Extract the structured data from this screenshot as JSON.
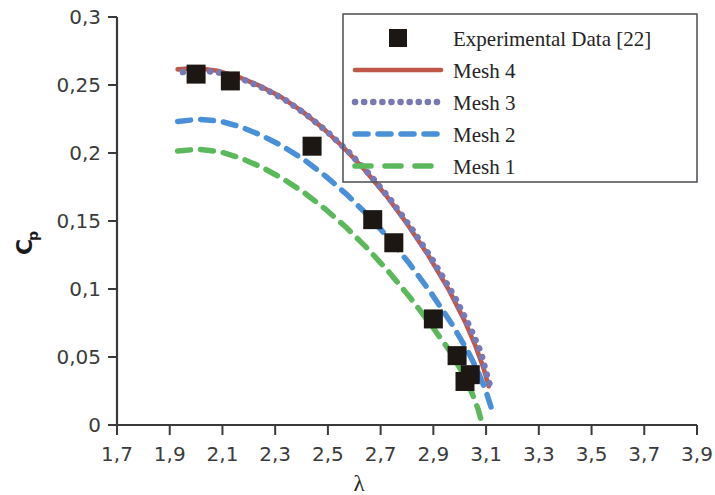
{
  "chart_data": {
    "type": "line",
    "title": "",
    "xlabel": "λ",
    "ylabel": "Cp",
    "ylabel_base": "C",
    "ylabel_sub": "p",
    "xlim": [
      1.7,
      3.9
    ],
    "ylim": [
      0.0,
      0.3
    ],
    "xticks": [
      "1,7",
      "1,9",
      "2,1",
      "2,3",
      "2,5",
      "2,7",
      "2,9",
      "3,1",
      "3,3",
      "3,5",
      "3,7",
      "3,9"
    ],
    "xtick_values": [
      1.7,
      1.9,
      2.1,
      2.3,
      2.5,
      2.7,
      2.9,
      3.1,
      3.3,
      3.5,
      3.7,
      3.9
    ],
    "yticks": [
      "0",
      "0,05",
      "0,1",
      "0,15",
      "0,2",
      "0,25",
      "0,3"
    ],
    "ytick_values": [
      0,
      0.05,
      0.1,
      0.15,
      0.2,
      0.25,
      0.3
    ],
    "grid": false,
    "legend_position": "top-right",
    "decimal_separator": ",",
    "series": [
      {
        "name": "Experimental Data [22]",
        "style": "scatter",
        "marker": "square",
        "color": "#1c1712",
        "points": [
          [
            2.0,
            0.258
          ],
          [
            2.13,
            0.253
          ],
          [
            2.44,
            0.205
          ],
          [
            2.67,
            0.151
          ],
          [
            2.75,
            0.134
          ],
          [
            2.9,
            0.078
          ],
          [
            2.99,
            0.051
          ],
          [
            3.02,
            0.032
          ],
          [
            3.04,
            0.037
          ]
        ]
      },
      {
        "name": "Mesh 4",
        "style": "solid",
        "color": "#c0584a",
        "points": [
          [
            1.93,
            0.2615
          ],
          [
            2.0,
            0.2625
          ],
          [
            2.08,
            0.2605
          ],
          [
            2.16,
            0.256
          ],
          [
            2.24,
            0.2495
          ],
          [
            2.32,
            0.2415
          ],
          [
            2.4,
            0.231
          ],
          [
            2.48,
            0.2185
          ],
          [
            2.56,
            0.204
          ],
          [
            2.64,
            0.1875
          ],
          [
            2.72,
            0.169
          ],
          [
            2.8,
            0.148
          ],
          [
            2.88,
            0.125
          ],
          [
            2.96,
            0.099
          ],
          [
            3.02,
            0.076
          ],
          [
            3.06,
            0.058
          ],
          [
            3.09,
            0.042
          ],
          [
            3.11,
            0.0285
          ]
        ]
      },
      {
        "name": "Mesh 3",
        "style": "dotted",
        "color": "#7878b4",
        "points": [
          [
            1.95,
            0.2595
          ],
          [
            2.02,
            0.2608
          ],
          [
            2.1,
            0.2588
          ],
          [
            2.18,
            0.254
          ],
          [
            2.26,
            0.2472
          ],
          [
            2.34,
            0.2388
          ],
          [
            2.42,
            0.228
          ],
          [
            2.5,
            0.2152
          ],
          [
            2.58,
            0.2005
          ],
          [
            2.66,
            0.1838
          ],
          [
            2.74,
            0.165
          ],
          [
            2.82,
            0.1438
          ],
          [
            2.9,
            0.1205
          ],
          [
            2.98,
            0.0945
          ],
          [
            3.04,
            0.0715
          ],
          [
            3.08,
            0.0535
          ],
          [
            3.1,
            0.039
          ],
          [
            3.12,
            0.0255
          ]
        ]
      },
      {
        "name": "Mesh 2",
        "style": "dashed",
        "color": "#4a90d9",
        "points": [
          [
            1.93,
            0.2232
          ],
          [
            2.01,
            0.2248
          ],
          [
            2.09,
            0.2235
          ],
          [
            2.17,
            0.2192
          ],
          [
            2.25,
            0.2128
          ],
          [
            2.33,
            0.2048
          ],
          [
            2.41,
            0.195
          ],
          [
            2.49,
            0.1832
          ],
          [
            2.57,
            0.1698
          ],
          [
            2.65,
            0.1545
          ],
          [
            2.73,
            0.1375
          ],
          [
            2.81,
            0.1185
          ],
          [
            2.89,
            0.0975
          ],
          [
            2.97,
            0.0742
          ],
          [
            3.03,
            0.0545
          ],
          [
            3.07,
            0.039
          ],
          [
            3.1,
            0.0245
          ],
          [
            3.12,
            0.0125
          ]
        ]
      },
      {
        "name": "Mesh 1",
        "style": "dashed",
        "color": "#5cb85c",
        "points": [
          [
            1.93,
            0.2015
          ],
          [
            2.01,
            0.2028
          ],
          [
            2.09,
            0.201
          ],
          [
            2.17,
            0.1962
          ],
          [
            2.25,
            0.1895
          ],
          [
            2.33,
            0.181
          ],
          [
            2.41,
            0.1708
          ],
          [
            2.49,
            0.1588
          ],
          [
            2.57,
            0.1452
          ],
          [
            2.65,
            0.1298
          ],
          [
            2.73,
            0.1128
          ],
          [
            2.81,
            0.0942
          ],
          [
            2.89,
            0.074
          ],
          [
            2.97,
            0.0522
          ],
          [
            3.02,
            0.0352
          ],
          [
            3.05,
            0.0218
          ],
          [
            3.07,
            0.0115
          ],
          [
            3.08,
            0.0045
          ]
        ]
      }
    ]
  },
  "legend": {
    "entries": [
      {
        "label": "Experimental Data [22]",
        "kind": "marker",
        "color": "#1c1712"
      },
      {
        "label": "Mesh 4",
        "kind": "solid",
        "color": "#c0584a"
      },
      {
        "label": "Mesh 3",
        "kind": "dotted",
        "color": "#7878b4"
      },
      {
        "label": "Mesh 2",
        "kind": "dashed",
        "color": "#4a90d9"
      },
      {
        "label": "Mesh 1",
        "kind": "dashed-wide",
        "color": "#5cb85c"
      }
    ]
  }
}
